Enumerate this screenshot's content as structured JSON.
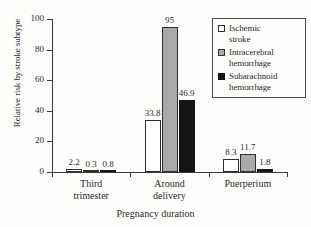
{
  "chart_data": {
    "type": "bar",
    "title": "",
    "xlabel": "Pregnancy duration",
    "ylabel": "Relative risk by stroke subtype",
    "categories": [
      "Third\ntrimester",
      "Around\ndelivery",
      "Puerperium"
    ],
    "category_labels": [
      {
        "line1": "Third",
        "line2": "trimester"
      },
      {
        "line1": "Around",
        "line2": "delivery"
      },
      {
        "line1": "Puerperium",
        "line2": ""
      }
    ],
    "series": [
      {
        "name": "Ischemic stroke",
        "color": "#ffffff",
        "values": [
          2.2,
          33.8,
          8.3
        ]
      },
      {
        "name": "Intracerebral hemorrhage",
        "color": "#a9a9a9",
        "values": [
          0.3,
          95,
          11.7
        ]
      },
      {
        "name": "Subarachnoid hemorrhage",
        "color": "#141414",
        "values": [
          0.8,
          46.9,
          1.8
        ]
      }
    ],
    "value_labels": [
      [
        "2.2",
        "0.3",
        "0.8"
      ],
      [
        "33.8",
        "95",
        "46.9"
      ],
      [
        "8.3",
        "11.7",
        "1.8"
      ]
    ],
    "ylim": [
      0,
      100
    ],
    "yticks": [
      0,
      20,
      40,
      60,
      80,
      100
    ],
    "ytick_labels": [
      "0",
      "20",
      "40",
      "60",
      "80",
      "100"
    ],
    "grid": false,
    "legend_position": "top-right",
    "legend": [
      {
        "label_line1": "Ischemic",
        "label_line2": "stroke",
        "swatch": "white-square-icon"
      },
      {
        "label_line1": "Intracerebral",
        "label_line2": "hemorrhage",
        "swatch": "gray-square-icon"
      },
      {
        "label_line1": "Subarachnoid",
        "label_line2": "hemorrhage",
        "swatch": "black-square-icon"
      }
    ]
  }
}
